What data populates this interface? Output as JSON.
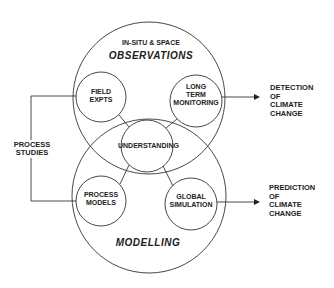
{
  "diagram": {
    "observations_subtitle": "IN-SITU & SPACE",
    "observations_title": "OBSERVATIONS",
    "modelling_title": "MODELLING",
    "nodes": {
      "field_expts": "FIELD\nEXPTS",
      "long_term_monitoring": "LONG\nTERM\nMONITORING",
      "understanding": "UNDERSTANDING",
      "process_models": "PROCESS\nMODELS",
      "global_simulation": "GLOBAL\nSIMULATION"
    },
    "process_studies": "PROCESS\nSTUDIES",
    "outputs": {
      "detection": "DETECTION\nOF\nCLIMATE\nCHANGE",
      "prediction": "PREDICTION\nOF\nCLIMATE\nCHANGE"
    },
    "colors": {
      "line": "#333333",
      "text": "#222222",
      "background": "#ffffff"
    }
  }
}
